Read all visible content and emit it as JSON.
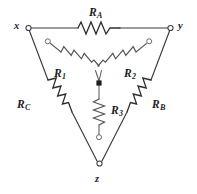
{
  "figure": {
    "kind": "circuit-schematic",
    "background_color": "#ffffff",
    "line_color": "#3b3b3f",
    "label_color": "#1c1c1f"
  },
  "nodes": [
    {
      "id": "x",
      "label": "x",
      "terminal": "open-circle"
    },
    {
      "id": "y",
      "label": "y",
      "terminal": "open-circle"
    },
    {
      "id": "z",
      "label": "z",
      "terminal": "open-circle"
    },
    {
      "id": "center",
      "label": "",
      "terminal": "filled-square-junction"
    }
  ],
  "delta_resistors": [
    {
      "id": "RA",
      "name": "R",
      "subscript": "A",
      "edge": "x-y",
      "orientation": "horizontal"
    },
    {
      "id": "RB",
      "name": "R",
      "subscript": "B",
      "edge": "y-z",
      "orientation": "diagonal"
    },
    {
      "id": "RC",
      "name": "R",
      "subscript": "C",
      "edge": "x-z",
      "orientation": "diagonal"
    }
  ],
  "wye_resistors": [
    {
      "id": "R1",
      "name": "R",
      "subscript": "1",
      "from": "terminal-1",
      "to": "center",
      "orientation": "diagonal"
    },
    {
      "id": "R2",
      "name": "R",
      "subscript": "2",
      "from": "terminal-2",
      "to": "center",
      "orientation": "diagonal"
    },
    {
      "id": "R3",
      "name": "R",
      "subscript": "3",
      "from": "center",
      "to": "terminal-3",
      "orientation": "vertical"
    }
  ],
  "labels": {
    "RA": {
      "base": "R",
      "sub": "A"
    },
    "RB": {
      "base": "R",
      "sub": "B"
    },
    "RC": {
      "base": "R",
      "sub": "C"
    },
    "R1": {
      "base": "R",
      "sub": "1"
    },
    "R2": {
      "base": "R",
      "sub": "2"
    },
    "R3": {
      "base": "R",
      "sub": "3"
    },
    "x": "x",
    "y": "y",
    "z": "z"
  }
}
